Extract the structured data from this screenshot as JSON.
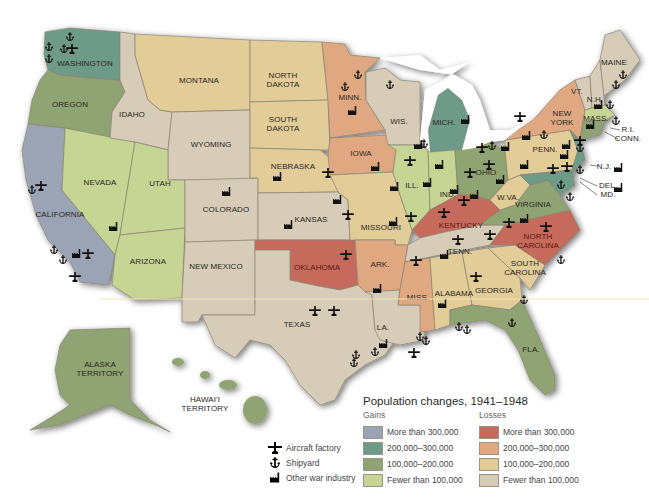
{
  "map": {
    "title": "Population changes, 1941–1948",
    "states": {
      "washington": "WASHINGTON",
      "oregon": "OREGON",
      "california": "CALIFORNIA",
      "nevada": "NEVADA",
      "idaho": "IDAHO",
      "montana": "MONTANA",
      "wyoming": "WYOMING",
      "utah": "UTAH",
      "arizona": "ARIZONA",
      "colorado": "COLORADO",
      "new_mexico": "NEW MEXICO",
      "north_dakota_1": "NORTH",
      "north_dakota_2": "DAKOTA",
      "south_dakota_1": "SOUTH",
      "south_dakota_2": "DAKOTA",
      "nebraska": "NEBRASKA",
      "kansas": "KANSAS",
      "oklahoma": "OKLAHOMA",
      "texas": "TEXAS",
      "minnesota": "MINN.",
      "iowa": "IOWA",
      "missouri": "MISSOURI",
      "arkansas": "ARK.",
      "louisiana": "LA.",
      "wisconsin": "WIS.",
      "illinois": "ILL.",
      "michigan": "MICH.",
      "indiana": "IND.",
      "ohio": "OHIO",
      "kentucky": "KENTUCKY",
      "tennessee": "TENN.",
      "mississippi": "MISS.",
      "alabama": "ALABAMA",
      "georgia": "GEORGIA",
      "florida": "FLA.",
      "south_carolina_1": "SOUTH",
      "south_carolina_2": "CAROLINA",
      "north_carolina_1": "NORTH",
      "north_carolina_2": "CAROLINA",
      "virginia": "VIRGINIA",
      "west_virginia": "W.VA.",
      "pennsylvania": "PENN.",
      "new_york_1": "NEW",
      "new_york_2": "YORK",
      "new_jersey": "N.J.",
      "delaware": "DEL.",
      "maryland": "MD.",
      "vermont": "VT.",
      "new_hampshire": "N.H.",
      "maine": "MAINE",
      "massachusetts": "MASS.",
      "rhode_island": "R.I.",
      "connecticut": "CONN.",
      "alaska_1": "ALASKA",
      "alaska_2": "TERRITORY",
      "hawaii_1": "HAWAI'I",
      "hawaii_2": "TERRITORY"
    }
  },
  "legend": {
    "title": "Population changes, 1941–1948",
    "gains": {
      "label": "Gains",
      "items": [
        {
          "label": "More than 300,000",
          "color": "#9aa4b4"
        },
        {
          "label": "200,000–300,000",
          "color": "#6e9a88"
        },
        {
          "label": "100,000–200,000",
          "color": "#8fa472"
        },
        {
          "label": "Fewer than 100,000",
          "color": "#c6d594"
        }
      ]
    },
    "losses": {
      "label": "Losses",
      "items": [
        {
          "label": "More than 300,000",
          "color": "#c66a5c"
        },
        {
          "label": "200,000–300,000",
          "color": "#e0a880"
        },
        {
          "label": "100,000–200,000",
          "color": "#e2cc98"
        },
        {
          "label": "Fewer than 100,000",
          "color": "#d6ccb8"
        }
      ]
    }
  },
  "key": {
    "items": [
      {
        "icon": "aircraft-factory-icon",
        "label": "Aircraft factory"
      },
      {
        "icon": "shipyard-anchor-icon",
        "label": "Shipyard"
      },
      {
        "icon": "factory-icon",
        "label": "Other war industry"
      }
    ]
  }
}
